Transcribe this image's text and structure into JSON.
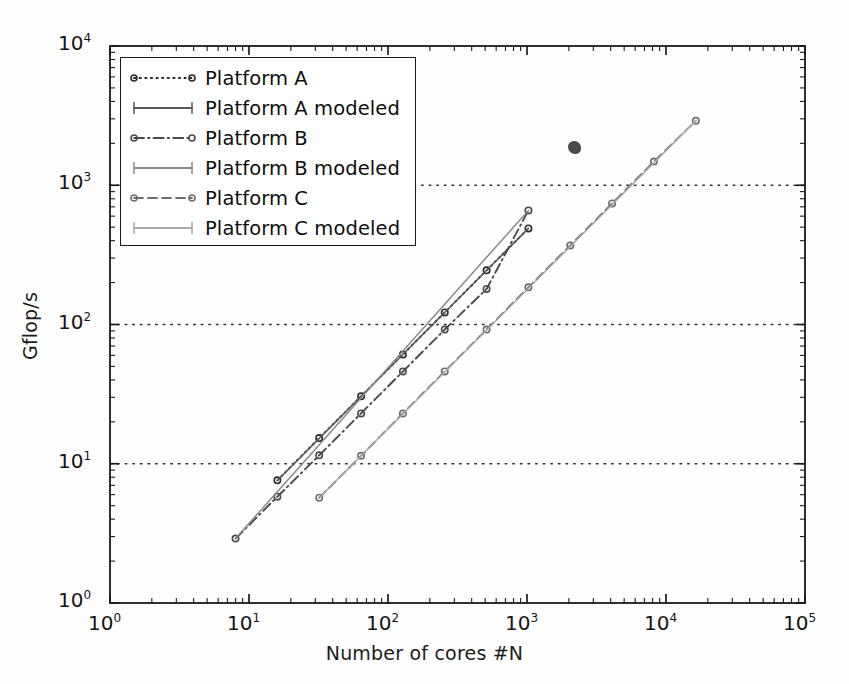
{
  "figure": {
    "title": "",
    "background": "#ffffff",
    "frame_color": "#1a1a1a"
  },
  "axes": {
    "x": {
      "label": "Number of cores #N",
      "scale": "log",
      "ticks": [
        "10",
        "10",
        "10",
        "10",
        "10",
        "10"
      ],
      "tick_exponents": [
        "0",
        "1",
        "2",
        "3",
        "4",
        "5"
      ],
      "lim": [
        1,
        100000
      ]
    },
    "y": {
      "label": "Gflop/s",
      "scale": "log",
      "ticks": [
        "10",
        "10",
        "10",
        "10",
        "10"
      ],
      "tick_exponents": [
        "0",
        "1",
        "2",
        "3",
        "4"
      ],
      "lim": [
        1,
        10000
      ]
    },
    "grid": {
      "horizontal": true,
      "vertical": false,
      "style": "dotted",
      "color": "#303030"
    }
  },
  "legend": {
    "position": "upper-left",
    "border_color": "#171717",
    "entries": [
      {
        "label": "Platform A",
        "style": "dotted",
        "marker": "circle",
        "color": "#2b2b2b"
      },
      {
        "label": "Platform A modeled",
        "style": "solid",
        "marker": "tick",
        "color": "#585858"
      },
      {
        "label": "Platform B",
        "style": "dashdot",
        "marker": "circle",
        "color": "#4a4a4a"
      },
      {
        "label": "Platform B modeled",
        "style": "solid",
        "marker": "tick",
        "color": "#8a8a8a"
      },
      {
        "label": "Platform C",
        "style": "dashed",
        "marker": "circle",
        "color": "#6d6d6d"
      },
      {
        "label": "Platform C modeled",
        "style": "solid",
        "marker": "tick",
        "color": "#a9a9a9"
      }
    ]
  },
  "chart_data": {
    "type": "line",
    "title": "",
    "xlabel": "Number of cores #N",
    "ylabel": "Gflop/s",
    "xscale": "log",
    "yscale": "log",
    "xlim": [
      1,
      100000
    ],
    "ylim": [
      1,
      10000
    ],
    "grid": "horizontal-dotted",
    "legend_position": "upper-left",
    "series": [
      {
        "name": "Platform A",
        "style": "dotted",
        "marker": "circle",
        "color": "#2b2b2b",
        "x": [
          16,
          32,
          64,
          128,
          256,
          512,
          1024
        ],
        "y": [
          7.6,
          15.3,
          30.5,
          61,
          122,
          245,
          490
        ]
      },
      {
        "name": "Platform A modeled",
        "style": "solid",
        "marker": "none",
        "color": "#585858",
        "x": [
          16,
          1024
        ],
        "y": [
          7.6,
          490
        ]
      },
      {
        "name": "Platform B",
        "style": "dashdot",
        "marker": "circle",
        "color": "#4a4a4a",
        "x": [
          8,
          16,
          32,
          64,
          128,
          256,
          512,
          1024
        ],
        "y": [
          2.9,
          5.8,
          11.5,
          23,
          46,
          92,
          180,
          660
        ]
      },
      {
        "name": "Platform B modeled",
        "style": "solid",
        "marker": "none",
        "color": "#8a8a8a",
        "x": [
          8,
          1024
        ],
        "y": [
          2.9,
          660
        ]
      },
      {
        "name": "Platform C",
        "style": "dashed",
        "marker": "circle",
        "color": "#6d6d6d",
        "x": [
          32,
          64,
          128,
          256,
          512,
          1024,
          2048,
          4096,
          8192,
          16384
        ],
        "y": [
          5.7,
          11.4,
          23,
          46,
          92,
          185,
          370,
          740,
          1480,
          2900
        ]
      },
      {
        "name": "Platform C modeled",
        "style": "solid",
        "marker": "none",
        "color": "#a9a9a9",
        "x": [
          32,
          16384
        ],
        "y": [
          5.7,
          2900
        ]
      }
    ],
    "annotations": [
      {
        "type": "ink-blot",
        "x": 2200,
        "y": 1850,
        "note": "scan artifact"
      }
    ]
  }
}
